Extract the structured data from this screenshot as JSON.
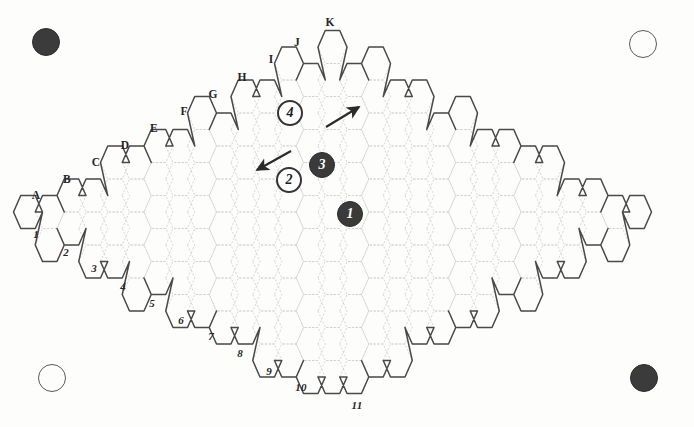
{
  "figure": {
    "kind": "hex-grid-game-board",
    "shape": "rhombus",
    "title": "",
    "background_color": "#fdfdfc",
    "border_color": "#4a4a4a",
    "grid_color": "#cfcfcf"
  },
  "board": {
    "hex_orientation": "flat-top",
    "hex_width": 29,
    "hex_height": 33,
    "columns": 22,
    "rows": 11,
    "left_vertex": {
      "x": 28,
      "y": 212
    },
    "right_vertex": {
      "x": 658,
      "y": 214
    },
    "top_vertex": {
      "x": 343,
      "y": 24
    },
    "bottom_vertex": {
      "x": 345,
      "y": 402
    }
  },
  "edge_labels": {
    "letters_caption": "A",
    "letters": [
      {
        "label": "A",
        "x": 36,
        "y": 196
      },
      {
        "label": "B",
        "x": 67,
        "y": 180
      },
      {
        "label": "C",
        "x": 96,
        "y": 163
      },
      {
        "label": "D",
        "x": 125,
        "y": 146
      },
      {
        "label": "E",
        "x": 154,
        "y": 129
      },
      {
        "label": "F",
        "x": 184,
        "y": 112
      },
      {
        "label": "G",
        "x": 213,
        "y": 95
      },
      {
        "label": "H",
        "x": 242,
        "y": 78
      },
      {
        "label": "I",
        "x": 271,
        "y": 60
      },
      {
        "label": "J",
        "x": 297,
        "y": 43
      },
      {
        "label": "K",
        "x": 330,
        "y": 23
      }
    ],
    "numbers": [
      {
        "label": "1",
        "x": 36,
        "y": 234
      },
      {
        "label": "2",
        "x": 66,
        "y": 252
      },
      {
        "label": "3",
        "x": 94,
        "y": 268
      },
      {
        "label": "4",
        "x": 123,
        "y": 286
      },
      {
        "label": "5",
        "x": 152,
        "y": 303
      },
      {
        "label": "6",
        "x": 181,
        "y": 320
      },
      {
        "label": "7",
        "x": 211,
        "y": 336
      },
      {
        "label": "8",
        "x": 240,
        "y": 353
      },
      {
        "label": "9",
        "x": 269,
        "y": 371
      },
      {
        "label": "10",
        "x": 301,
        "y": 387
      },
      {
        "label": "11",
        "x": 357,
        "y": 405
      }
    ]
  },
  "tokens": [
    {
      "id": "token-4",
      "number": "4",
      "style": "light",
      "x": 290,
      "y": 113
    },
    {
      "id": "token-2",
      "number": "2",
      "style": "light",
      "x": 289,
      "y": 180
    },
    {
      "id": "token-3",
      "number": "3",
      "style": "dark",
      "x": 322,
      "y": 165
    },
    {
      "id": "token-1",
      "number": "1",
      "style": "dark",
      "x": 350,
      "y": 214
    }
  ],
  "arrows": [
    {
      "id": "arrow-up-right",
      "direction": "up-right",
      "from": {
        "x": 326,
        "y": 127
      },
      "to": {
        "x": 359,
        "y": 107
      }
    },
    {
      "id": "arrow-down-left",
      "direction": "down-left",
      "from": {
        "x": 291,
        "y": 151
      },
      "to": {
        "x": 257,
        "y": 170
      }
    }
  ],
  "corner_markers": [
    {
      "id": "corner-tl",
      "position": "top-left",
      "style": "filled",
      "color": "#3b3b3b"
    },
    {
      "id": "corner-tr",
      "position": "top-right",
      "style": "outline",
      "color": "#5a5a5a"
    },
    {
      "id": "corner-bl",
      "position": "bottom-left",
      "style": "outline",
      "color": "#5a5a5a"
    },
    {
      "id": "corner-br",
      "position": "bottom-right",
      "style": "filled",
      "color": "#3b3b3b"
    }
  ]
}
